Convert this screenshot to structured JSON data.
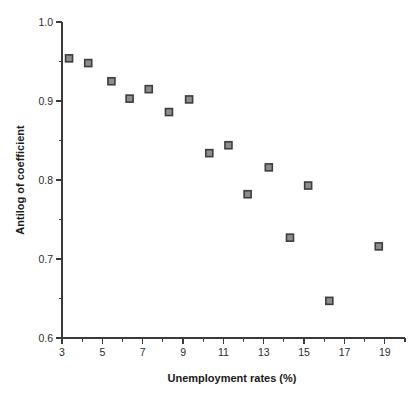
{
  "chart_data": {
    "type": "scatter",
    "title": "",
    "xlabel": "Unemployment rates (%)",
    "ylabel": "Antilog of coefficient",
    "xlim": [
      3,
      20
    ],
    "ylim": [
      0.6,
      1.0
    ],
    "grid": false,
    "legend": null,
    "x_major_ticks": [
      3,
      5,
      7,
      9,
      11,
      13,
      15,
      17,
      19
    ],
    "x_major_tick_labels": [
      "3",
      "5",
      "7",
      "9",
      "11",
      "13",
      "15",
      "17",
      "19"
    ],
    "x_minor_ticks": [
      4,
      6,
      8,
      10,
      12,
      14,
      16,
      18,
      20
    ],
    "y_major_ticks": [
      0.6,
      0.7,
      0.8,
      0.9,
      1.0
    ],
    "y_major_tick_labels": [
      "0.6",
      "0.7",
      "0.8",
      "0.9",
      "1.0"
    ],
    "y_minor_ticks": [
      0.65,
      0.75,
      0.85,
      0.95
    ],
    "marker": {
      "shape": "square",
      "size_px": 7,
      "fill_color": "#8d8d8d",
      "edge_color": "#3d3d3d"
    },
    "axis_color": "#3a3a3a",
    "background_color": "#ffffff",
    "points": [
      {
        "x": 3.35,
        "y": 0.954
      },
      {
        "x": 4.3,
        "y": 0.948
      },
      {
        "x": 5.45,
        "y": 0.925
      },
      {
        "x": 6.35,
        "y": 0.903
      },
      {
        "x": 7.3,
        "y": 0.915
      },
      {
        "x": 8.3,
        "y": 0.886
      },
      {
        "x": 9.3,
        "y": 0.902
      },
      {
        "x": 10.3,
        "y": 0.834
      },
      {
        "x": 11.25,
        "y": 0.844
      },
      {
        "x": 12.2,
        "y": 0.782
      },
      {
        "x": 13.25,
        "y": 0.816
      },
      {
        "x": 14.3,
        "y": 0.727
      },
      {
        "x": 15.2,
        "y": 0.793
      },
      {
        "x": 16.25,
        "y": 0.647
      },
      {
        "x": 18.7,
        "y": 0.716
      }
    ]
  }
}
